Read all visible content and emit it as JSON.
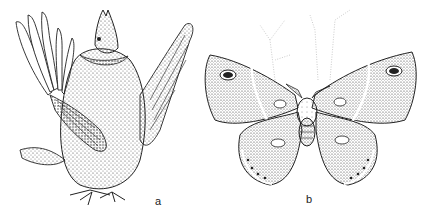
{
  "figure": {
    "panels": [
      {
        "label": "a",
        "subject": "ruffed grouse in display posture (pen-and-ink drawing)"
      },
      {
        "label": "b",
        "subject": "saturniid moth with eyespots, wings spread (pen-and-ink drawing)"
      }
    ]
  },
  "colors": {
    "ink": "#222222",
    "paper": "#ffffff",
    "stipple": "#555555"
  }
}
